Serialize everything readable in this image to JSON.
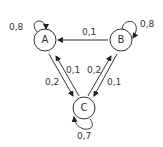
{
  "nodes": [
    {
      "id": "A",
      "label": "A",
      "self_loop": "0,8"
    },
    {
      "id": "B",
      "label": "B",
      "self_loop": "0,8"
    },
    {
      "id": "C",
      "label": "C",
      "self_loop": "0,7"
    }
  ],
  "edges": [
    {
      "from": "B",
      "to": "A",
      "label": "0,1"
    },
    {
      "from": "A",
      "to": "C",
      "label": "0,2"
    },
    {
      "from": "C",
      "to": "A",
      "label": "0,1"
    },
    {
      "from": "C",
      "to": "B",
      "label": "0,2"
    },
    {
      "from": "B",
      "to": "C",
      "label": "0,1"
    }
  ]
}
